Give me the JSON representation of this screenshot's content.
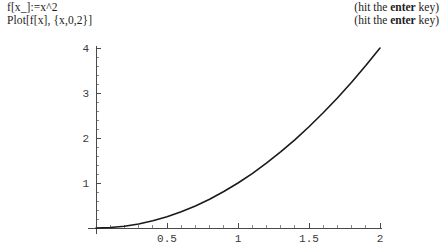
{
  "code": {
    "lines": [
      "f[x_]:=x^2",
      "Plot[f[x], {x,0,2}]"
    ]
  },
  "hints": {
    "lines": [
      {
        "prefix": "(hit the ",
        "emphasis": "enter",
        "suffix": " key)"
      },
      {
        "prefix": "(hit the ",
        "emphasis": "enter",
        "suffix": " key)"
      }
    ]
  },
  "chart_data": {
    "type": "line",
    "title": "",
    "xlabel": "",
    "ylabel": "",
    "expression": "x^2",
    "xlim": [
      0,
      2
    ],
    "ylim": [
      0,
      4
    ],
    "grid": false,
    "legend": false,
    "x_ticks": [
      {
        "value": 0,
        "label": ""
      },
      {
        "value": 0.5,
        "label": "0.5"
      },
      {
        "value": 1,
        "label": "1"
      },
      {
        "value": 1.5,
        "label": "1.5"
      },
      {
        "value": 2,
        "label": "2"
      }
    ],
    "y_ticks": [
      {
        "value": 0,
        "label": ""
      },
      {
        "value": 1,
        "label": "1"
      },
      {
        "value": 2,
        "label": "2"
      },
      {
        "value": 3,
        "label": "3"
      },
      {
        "value": 4,
        "label": "4"
      }
    ],
    "x_minor_step": 0.1,
    "y_minor_step": 0.2,
    "series": [
      {
        "name": "f(x) = x^2",
        "x": [
          0,
          0.1,
          0.2,
          0.3,
          0.4,
          0.5,
          0.6,
          0.7,
          0.8,
          0.9,
          1.0,
          1.1,
          1.2,
          1.3,
          1.4,
          1.5,
          1.6,
          1.7,
          1.8,
          1.9,
          2.0
        ],
        "values": [
          0,
          0.01,
          0.04,
          0.09,
          0.16,
          0.25,
          0.36,
          0.49,
          0.64,
          0.81,
          1.0,
          1.21,
          1.44,
          1.69,
          1.96,
          2.25,
          2.56,
          2.89,
          3.24,
          3.61,
          4.0
        ]
      }
    ],
    "colors": {
      "curve": "#1a1a1a",
      "axis": "#4a4a4a",
      "minor_tick": "#8a8a8a",
      "background": "#ffffff"
    }
  }
}
